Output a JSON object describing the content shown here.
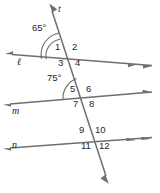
{
  "figure": {
    "type": "geometry-diagram",
    "background_color": "#ffffff",
    "stroke_color": "#6e6e6e",
    "text_color": "#1f1f1f",
    "lines": [
      {
        "name": "t",
        "role": "transversal",
        "label": "t"
      },
      {
        "name": "l",
        "role": "parallel-line",
        "label": "ℓ"
      },
      {
        "name": "m",
        "role": "parallel-line",
        "label": "m"
      },
      {
        "name": "n",
        "role": "parallel-line",
        "label": "n"
      }
    ],
    "angle_measures": [
      {
        "id": "measure-65",
        "value": "65°",
        "at_intersection": "l"
      },
      {
        "id": "measure-75",
        "value": "75°",
        "at_intersection": "m"
      }
    ],
    "angle_numbers": [
      {
        "id": "angle-1",
        "label": "1",
        "intersection": "l"
      },
      {
        "id": "angle-2",
        "label": "2",
        "intersection": "l"
      },
      {
        "id": "angle-3",
        "label": "3",
        "intersection": "l"
      },
      {
        "id": "angle-4",
        "label": "4",
        "intersection": "l"
      },
      {
        "id": "angle-5",
        "label": "5",
        "intersection": "m"
      },
      {
        "id": "angle-6",
        "label": "6",
        "intersection": "m"
      },
      {
        "id": "angle-7",
        "label": "7",
        "intersection": "m"
      },
      {
        "id": "angle-8",
        "label": "8",
        "intersection": "m"
      },
      {
        "id": "angle-9",
        "label": "9",
        "intersection": "n"
      },
      {
        "id": "angle-10",
        "label": "10",
        "intersection": "n"
      },
      {
        "id": "angle-11",
        "label": "11",
        "intersection": "n"
      },
      {
        "id": "angle-12",
        "label": "12",
        "intersection": "n"
      }
    ]
  }
}
